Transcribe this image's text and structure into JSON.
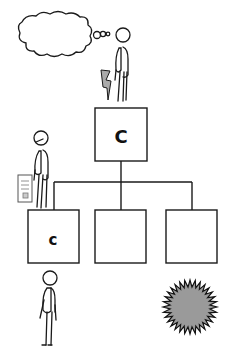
{
  "diagram": {
    "type": "org-chart-illustration",
    "top_box": {
      "label": "C"
    },
    "children": [
      {
        "label": "c"
      },
      {
        "label": ""
      },
      {
        "label": ""
      }
    ],
    "figures": [
      {
        "name": "thinking-figure",
        "position": "on-top-box",
        "holding": "lightning-bolt"
      },
      {
        "name": "document-figure",
        "position": "on-left-child-box",
        "holding": "document"
      },
      {
        "name": "standing-figure",
        "position": "below-left-child-box"
      }
    ],
    "thought_bubble": {
      "text": ""
    },
    "starburst": {
      "fill": "#9a9a9a",
      "stroke": "#111111"
    },
    "colors": {
      "line": "#1a1a1a",
      "background": "#ffffff"
    }
  }
}
